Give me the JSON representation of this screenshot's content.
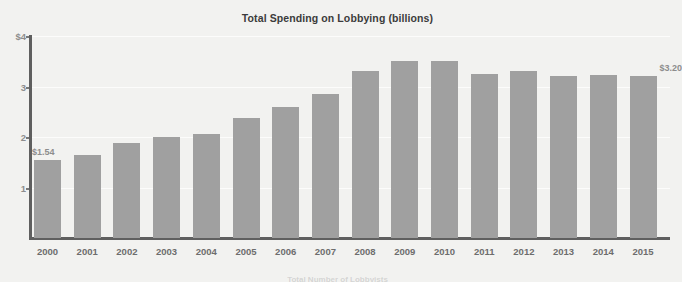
{
  "chart_data": {
    "type": "bar",
    "title": "Total Spending on Lobbying (billions)",
    "xlabel": "",
    "ylabel": "",
    "ylim": [
      0,
      4
    ],
    "grid": true,
    "legend": "none",
    "categories": [
      "2000",
      "2001",
      "2002",
      "2003",
      "2004",
      "2005",
      "2006",
      "2007",
      "2008",
      "2009",
      "2010",
      "2011",
      "2012",
      "2013",
      "2014",
      "2015"
    ],
    "values": [
      1.54,
      1.64,
      1.88,
      2.01,
      2.06,
      2.38,
      2.59,
      2.85,
      3.3,
      3.5,
      3.51,
      3.25,
      3.31,
      3.21,
      3.23,
      3.2
    ],
    "y_ticks": [
      "$4",
      "3",
      "2",
      "1"
    ],
    "y_tick_values": [
      4,
      3,
      2,
      1
    ],
    "annotations": [
      {
        "category": "2000",
        "label": "$1.54"
      },
      {
        "category": "2015",
        "label": "$3.20"
      }
    ],
    "colors": {
      "bar": "#a0a0a0",
      "background": "#f2f2f0",
      "axis": "#5f5f5f",
      "tick_text": "#8d8d8d",
      "x_label_text": "#6d6d6d",
      "title_text": "#3b3b3b",
      "gridline": "#ffffff"
    }
  },
  "caption": {
    "bottom_partial": "Total Number of Lobbyists"
  }
}
